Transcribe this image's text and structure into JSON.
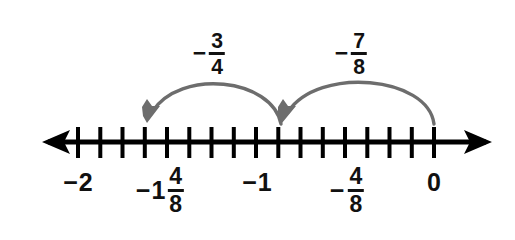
{
  "figure": {
    "type": "number-line-diagram",
    "width": 515,
    "height": 240,
    "background_color": "#ffffff",
    "line_color": "#000000",
    "arc_color": "#6d6d6d",
    "text_color": "#111111"
  },
  "number_line": {
    "axis_y": 142,
    "left_arrow_tip_x": 42,
    "right_arrow_tip_x": 492,
    "min_value": -2,
    "max_value": 0,
    "tick_step": "1/8",
    "tick_count": 17,
    "first_tick_x": 78,
    "last_tick_x": 434,
    "pixels_per_unit": 178,
    "tick_values": [
      -2,
      -1.875,
      -1.75,
      -1.625,
      -1.5,
      -1.375,
      -1.25,
      -1.125,
      -1,
      -0.875,
      -0.75,
      -0.625,
      -0.5,
      -0.375,
      -0.25,
      -0.125,
      0
    ],
    "tick_top_y": 127,
    "tick_bottom_y": 158
  },
  "tick_labels": [
    {
      "id": "label-neg-2",
      "name": "tick-label-neg-2",
      "value": -2,
      "x": 78,
      "y": 170,
      "sign": "−",
      "whole": "2",
      "has_fraction": false,
      "numerator": "",
      "denominator": "",
      "text": "−2"
    },
    {
      "id": "label-neg-1-and-4-8",
      "name": "tick-label-neg-1-and-4-8",
      "value": -1.5,
      "x": 160,
      "y": 165,
      "sign": "−",
      "whole": "1",
      "has_fraction": true,
      "numerator": "4",
      "denominator": "8",
      "text": "−1 4/8"
    },
    {
      "id": "label-neg-1",
      "name": "tick-label-neg-1",
      "value": -1,
      "x": 257,
      "y": 170,
      "sign": "−",
      "whole": "1",
      "has_fraction": false,
      "numerator": "",
      "denominator": "",
      "text": "−1"
    },
    {
      "id": "label-neg-4-8",
      "name": "tick-label-neg-4-8",
      "value": -0.5,
      "x": 347,
      "y": 165,
      "sign": "−",
      "whole": "",
      "has_fraction": true,
      "numerator": "4",
      "denominator": "8",
      "text": "−4/8"
    },
    {
      "id": "label-0",
      "name": "tick-label-0",
      "value": 0,
      "x": 434,
      "y": 170,
      "sign": "",
      "whole": "0",
      "has_fraction": false,
      "numerator": "",
      "denominator": "",
      "text": "0"
    }
  ],
  "jumps": [
    {
      "id": "jump-left",
      "name": "jump-arc-neg-three-quarters",
      "from_value": -0.75,
      "to_value": -1.5,
      "start_x": 281,
      "end_x": 149,
      "start_y": 124,
      "end_y": 121,
      "peak_y": 76,
      "direction": "leftward",
      "label": {
        "id": "jump-label-neg-3-4",
        "name": "jump-label-neg-3-4",
        "x": 209,
        "y": 30,
        "sign": "−",
        "whole": "",
        "numerator": "3",
        "denominator": "4",
        "text": "−3/4"
      }
    },
    {
      "id": "jump-right",
      "name": "jump-arc-neg-seven-eighths",
      "from_value": 0,
      "to_value": -0.875,
      "start_x": 434,
      "end_x": 284,
      "start_y": 124,
      "end_y": 121,
      "peak_y": 76,
      "direction": "leftward",
      "label": {
        "id": "jump-label-neg-7-8",
        "name": "jump-label-neg-7-8",
        "x": 351,
        "y": 30,
        "sign": "−",
        "whole": "",
        "numerator": "7",
        "denominator": "8",
        "text": "−7/8"
      }
    }
  ]
}
